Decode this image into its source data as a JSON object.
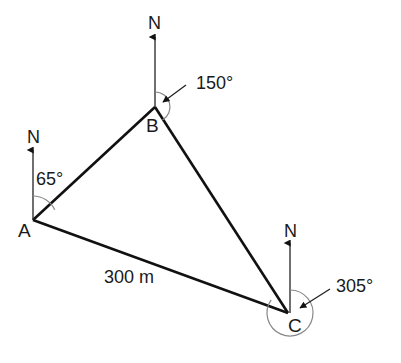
{
  "diagram": {
    "type": "bearings-triangle",
    "colors": {
      "line": "#111111",
      "arc": "#888888",
      "text": "#1a1a1a",
      "background": "#ffffff"
    },
    "vertices": {
      "A": {
        "label": "A",
        "x": 33,
        "y": 220
      },
      "B": {
        "label": "B",
        "x": 155,
        "y": 107
      },
      "C": {
        "label": "C",
        "x": 288,
        "y": 313
      }
    },
    "north_label": "N",
    "bearings": {
      "A": "65°",
      "B": "150°",
      "C": "305°"
    },
    "sides": {
      "AC": "300 m"
    }
  }
}
